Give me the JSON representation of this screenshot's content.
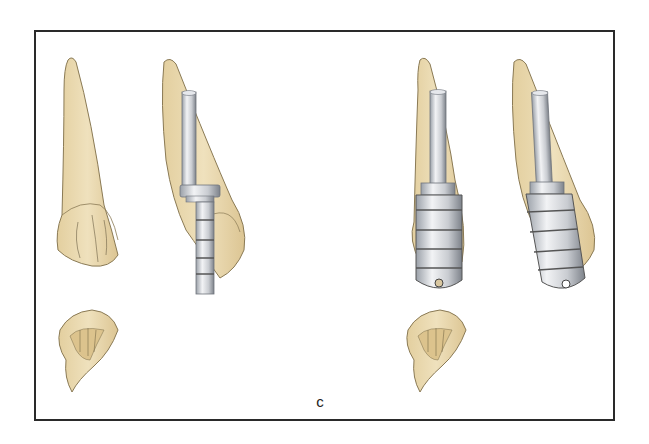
{
  "figure": {
    "panel_label": "c",
    "colors": {
      "tooth": "#ead9b0",
      "tooth_outline": "#8a7a55",
      "metal_light": "#e6e8ec",
      "metal_mid": "#b9bdc4",
      "metal_dark": "#6f747c",
      "frame": "#2a2a2a"
    },
    "items": [
      {
        "id": "tooth-labial-plain",
        "description": "Incisor, labial view"
      },
      {
        "id": "tooth-proximal-with-post",
        "description": "Incisor, proximal view with stepped drill/post"
      },
      {
        "id": "tooth-labial-with-sleeve",
        "description": "Incisor, labial view with grooved sleeve attachment"
      },
      {
        "id": "tooth-proximal-with-sleeve",
        "description": "Incisor, proximal view with grooved sleeve attachment"
      },
      {
        "id": "tooth-incisal-plain",
        "description": "Incisal view of tooth"
      },
      {
        "id": "tooth-incisal-second",
        "description": "Incisal view of tooth"
      }
    ]
  }
}
